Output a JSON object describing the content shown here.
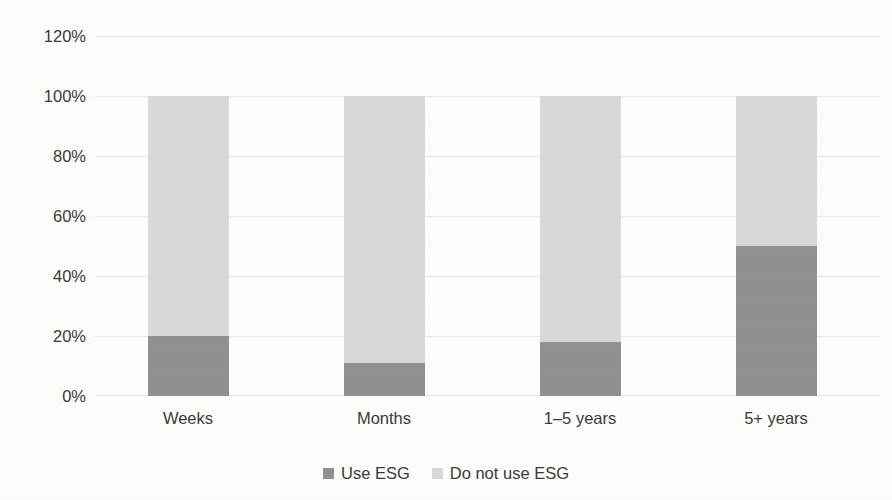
{
  "chart_data": {
    "type": "bar",
    "subtype": "stacked-100-percent",
    "title": "",
    "subtitle": "",
    "xlabel": "",
    "ylabel": "",
    "categories": [
      "Weeks",
      "Months",
      "1–5 years",
      "5+ years"
    ],
    "series": [
      {
        "name": "Use ESG",
        "values": [
          20,
          11,
          18,
          50
        ],
        "color": "#919191"
      },
      {
        "name": "Do not use ESG",
        "values": [
          80,
          89,
          82,
          50
        ],
        "color": "#d9d9d9"
      }
    ],
    "ylim": [
      0,
      120
    ],
    "ytick_labels": [
      "0%",
      "20%",
      "40%",
      "60%",
      "80%",
      "100%",
      "120%"
    ],
    "ytick_values": [
      0,
      20,
      40,
      60,
      80,
      100,
      120
    ],
    "grid": true,
    "grid_axis": "y",
    "legend_position": "bottom",
    "value_unit": "%",
    "annotations": []
  },
  "axis": {
    "y_labels": [
      {
        "text": "120%",
        "value": 120
      },
      {
        "text": "100%",
        "value": 100
      },
      {
        "text": "80%",
        "value": 80
      },
      {
        "text": "60%",
        "value": 60
      },
      {
        "text": "40%",
        "value": 40
      },
      {
        "text": "20%",
        "value": 20
      },
      {
        "text": "0%",
        "value": 0
      }
    ],
    "x_labels": [
      {
        "text": "Weeks"
      },
      {
        "text": "Months"
      },
      {
        "text": "1–5 years"
      },
      {
        "text": "5+ years"
      }
    ]
  },
  "legend": {
    "items": [
      {
        "label": "Use ESG",
        "color": "#919191"
      },
      {
        "label": "Do not use ESG",
        "color": "#d9d9d9"
      }
    ]
  },
  "colors": {
    "background": "#fdfdfc",
    "gridline": "#e6e6e6",
    "text": "#3a3a3a",
    "series_use_esg": "#919191",
    "series_do_not_use_esg": "#d9d9d9"
  }
}
